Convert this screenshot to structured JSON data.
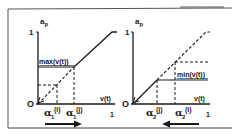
{
  "figure": {
    "colors": {
      "ink": "#1a1a1a",
      "background": "#ffffff",
      "frame": "#555555"
    },
    "left_panel": {
      "y_axis_label": "a_p",
      "y_axis_label_main": "a",
      "y_axis_label_sub": "p",
      "y_top_tick": "1",
      "x_axis_label": "v(t)",
      "origin_label": "O",
      "x_end_tick": "1",
      "annotation": "max(v(t))",
      "tick1_symbol": "α",
      "tick1_sub": "1",
      "tick1_sup": "(i)",
      "tick2_symbol": "α",
      "tick2_sub": "1",
      "tick2_sup": "(j)",
      "arrow_direction": "right"
    },
    "right_panel": {
      "y_axis_label": "a_p",
      "y_axis_label_main": "a",
      "y_axis_label_sub": "p",
      "y_top_tick": "1",
      "x_axis_label": "v(t)",
      "origin_label": "O",
      "x_end_tick": "1",
      "annotation": "min(v(t))",
      "tick1_symbol": "α",
      "tick1_sub": "2",
      "tick1_sup": "(j)",
      "tick2_symbol": "α",
      "tick2_sub": "2",
      "tick2_sup": "(i)",
      "arrow_direction": "left"
    }
  }
}
